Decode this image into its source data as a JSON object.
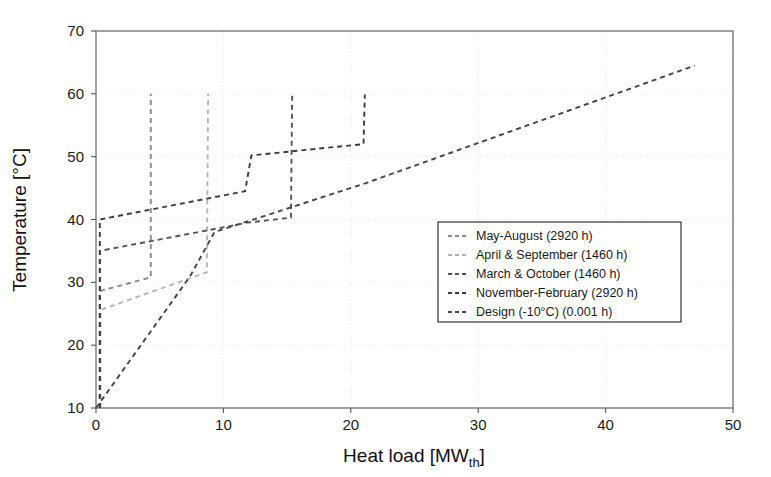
{
  "chart_data": {
    "type": "line",
    "title": "",
    "xlabel": "Heat load [MW",
    "xlabel_sub": "th",
    "xlabel_tail": "]",
    "ylabel": "Temperature [°C]",
    "xlim": [
      0,
      50
    ],
    "ylim": [
      10,
      70
    ],
    "xticks": [
      0,
      10,
      20,
      30,
      40,
      50
    ],
    "yticks": [
      10,
      20,
      30,
      40,
      50,
      60,
      70
    ],
    "grid": true,
    "legend_position": "center-right",
    "series": [
      {
        "name": "May-August (2920 h)",
        "color": "#8a8a8a",
        "dash": "5 4",
        "points": [
          [
            0.3,
            10.0
          ],
          [
            0.3,
            28.6
          ],
          [
            4.3,
            30.8
          ],
          [
            4.3,
            60.0
          ]
        ]
      },
      {
        "name": "April & September (1460 h)",
        "color": "#b4b4b4",
        "dash": "5 4",
        "points": [
          [
            0.35,
            10.0
          ],
          [
            0.35,
            25.6
          ],
          [
            8.7,
            31.6
          ],
          [
            8.8,
            60.0
          ]
        ]
      },
      {
        "name": "March & October (1460 h)",
        "color": "#555555",
        "dash": "5 4",
        "points": [
          [
            0.3,
            10.0
          ],
          [
            0.3,
            35.0
          ],
          [
            11.9,
            39.5
          ],
          [
            15.3,
            40.3
          ],
          [
            15.4,
            60.0
          ]
        ]
      },
      {
        "name": "November-February (2920 h)",
        "color": "#3c3c3c",
        "dash": "5 4",
        "points": [
          [
            0.3,
            10.0
          ],
          [
            0.3,
            40.0
          ],
          [
            11.7,
            44.5
          ],
          [
            12.2,
            50.2
          ],
          [
            21.0,
            52.0
          ],
          [
            21.1,
            59.9
          ]
        ]
      },
      {
        "name": "Design (-10°C) (0.001 h)",
        "color": "#444444",
        "dash": "5 4",
        "points": [
          [
            0.0,
            10.0
          ],
          [
            7.4,
            31.0
          ],
          [
            9.3,
            38.0
          ],
          [
            21.2,
            45.8
          ],
          [
            47.0,
            64.5
          ]
        ]
      }
    ]
  },
  "legend": {
    "entries": [
      "May-August (2920 h)",
      "April & September (1460 h)",
      "March & October (1460 h)",
      "November-February (2920 h)",
      "Design (-10°C) (0.001 h)"
    ]
  },
  "axes": {
    "x_tick_labels": [
      "0",
      "10",
      "20",
      "30",
      "40",
      "50"
    ],
    "y_tick_labels": [
      "10",
      "20",
      "30",
      "40",
      "50",
      "60",
      "70"
    ],
    "x_title_main": "Heat load [MW",
    "x_title_sub": "th",
    "x_title_close": "]",
    "y_title": "Temperature [°C]"
  }
}
